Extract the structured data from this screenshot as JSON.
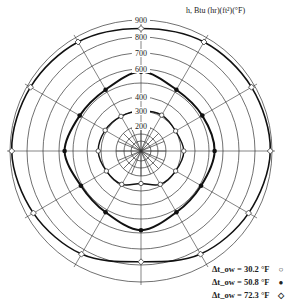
{
  "chart_data": {
    "type": "polar",
    "title": "h, Btu (hr)(ft²)(°F)",
    "radial_label": "h, Btu (hr)(ft²)(°F)",
    "radial_ticks": [
      200,
      300,
      400,
      500,
      600,
      700,
      800,
      900
    ],
    "radial_tick_labels": [
      "200",
      "300",
      "400",
      "",
      "600",
      "700",
      "800",
      "900"
    ],
    "angles_deg": [
      0,
      30,
      60,
      90,
      120,
      150,
      180,
      210,
      240,
      270,
      300,
      330
    ],
    "series": [
      {
        "name": "Δt_ow = 30.2 °F",
        "marker": "open-circle",
        "values": [
          300,
          310,
          300,
          320,
          300,
          290,
          250,
          290,
          300,
          320,
          310,
          300
        ]
      },
      {
        "name": "Δt_ow = 50.8 °F",
        "marker": "filled-circle",
        "values": [
          580,
          520,
          520,
          540,
          510,
          520,
          580,
          520,
          510,
          560,
          520,
          520
        ]
      },
      {
        "name": "Δt_ow = 72.3 °F",
        "marker": "open-diamond",
        "values": [
          850,
          870,
          880,
          890,
          860,
          830,
          780,
          830,
          860,
          890,
          880,
          870
        ]
      }
    ],
    "grid": true,
    "legend_position": "bottom-right"
  },
  "legend": {
    "items": [
      {
        "label": "Δt_ow = 30.2 °F",
        "marker": "○"
      },
      {
        "label": "Δt_ow = 50.8 °F",
        "marker": "●"
      },
      {
        "label": "Δt_ow = 72.3 °F",
        "marker": "◇"
      }
    ]
  },
  "labels": {
    "title": "h, Btu (hr)(ft²)(°F)",
    "t900": "900",
    "t800": "800",
    "t700": "700",
    "t600": "600",
    "t400": "400",
    "t300": "300",
    "t200": "200"
  }
}
